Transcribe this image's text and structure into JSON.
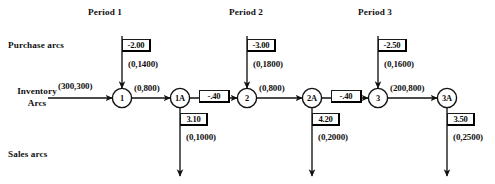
{
  "figure": {
    "title_row": {
      "periods": [
        {
          "label": "Period 1"
        },
        {
          "label": "Period 2"
        },
        {
          "label": "Period 3"
        }
      ]
    },
    "row_labels": {
      "purchase": "Purchase arcs",
      "inventory_line1": "Inventory",
      "inventory_line2": "Arcs",
      "sales": "Sales arcs"
    },
    "nodes": [
      {
        "id": "1",
        "label": "1"
      },
      {
        "id": "1A",
        "label": "1A"
      },
      {
        "id": "2",
        "label": "2"
      },
      {
        "id": "2A",
        "label": "2A"
      },
      {
        "id": "3",
        "label": "3"
      },
      {
        "id": "3A",
        "label": "3A"
      }
    ],
    "inventory_arcs": [
      {
        "name": "entry-arc",
        "bounds": "(300,300)",
        "cost": null
      },
      {
        "name": "arc-1-to-1A",
        "bounds": "(0,800)",
        "cost": null
      },
      {
        "name": "arc-1A-to-2",
        "bounds": null,
        "cost": "-.40"
      },
      {
        "name": "arc-2-to-2A",
        "bounds": "(0,800)",
        "cost": null
      },
      {
        "name": "arc-2A-to-3",
        "bounds": null,
        "cost": "-.40"
      },
      {
        "name": "arc-3-to-3A",
        "bounds": "(200,800)",
        "cost": null
      }
    ],
    "purchase_arcs": [
      {
        "period": "Period 1",
        "target_node": "1",
        "cost": "-2.00",
        "bounds": "(0,1400)"
      },
      {
        "period": "Period 2",
        "target_node": "2",
        "cost": "-3.00",
        "bounds": "(0,1800)"
      },
      {
        "period": "Period 3",
        "target_node": "3",
        "cost": "-2.50",
        "bounds": "(0,1600)"
      }
    ],
    "sales_arcs": [
      {
        "period": "Period 1",
        "source_node": "1A",
        "cost": "3.10",
        "bounds": "(0,1000)"
      },
      {
        "period": "Period 2",
        "source_node": "2A",
        "cost": "4.20",
        "bounds": "(0,2000)"
      },
      {
        "period": "Period 3",
        "source_node": "3A",
        "cost": "3.50",
        "bounds": "(0,2500)"
      }
    ],
    "colors": {
      "ink": "#111111",
      "background": "#ffffff",
      "box_border": "#1a1a1a"
    }
  }
}
